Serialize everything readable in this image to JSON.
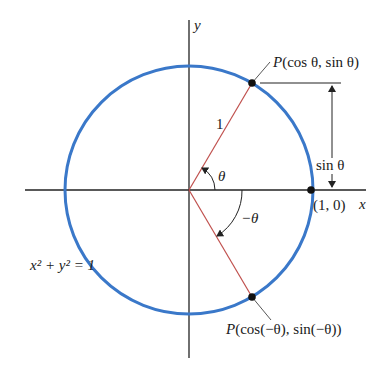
{
  "diagram": {
    "colors": {
      "circle": "#3a78c9",
      "radius": "#c0504d",
      "axis": "#222222",
      "point": "#111111"
    },
    "labels": {
      "y_axis": "y",
      "x_axis": "x",
      "point_upper": "P(cos θ, sin θ)",
      "point_upper_p": "P",
      "point_upper_rest": "(cos θ, sin θ)",
      "point_lower": "P(cos(−θ), sin(−θ))",
      "point_lower_p": "P",
      "point_lower_rest": "(cos(−θ), sin(−θ))",
      "radius_length": "1",
      "angle_pos": "θ",
      "angle_neg": "−θ",
      "sin_dimension": "sin θ",
      "unit_point": "(1, 0)",
      "equation": "x² + y² = 1"
    }
  }
}
